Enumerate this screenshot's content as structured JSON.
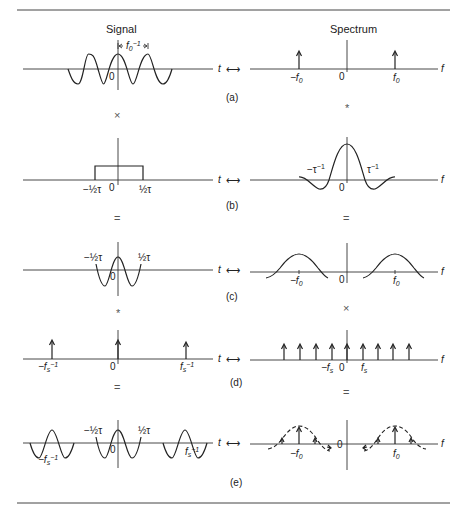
{
  "figure": {
    "column_titles": {
      "signal": "Signal",
      "spectrum": "Spectrum"
    },
    "axis_labels": {
      "time": "t",
      "freq": "f",
      "transform_pair": "⟷"
    },
    "origin": "0",
    "rows": [
      {
        "label": "(a)",
        "signal": {
          "description": "cosine of period 1/f0",
          "period_marker": "f0⁻¹",
          "period_marker_base": "f",
          "period_marker_sub": "0",
          "period_marker_sup": "−1"
        },
        "spectrum": {
          "description": "delta impulses at ±f0",
          "ticks": [
            {
              "text": "−f",
              "sub": "0"
            },
            {
              "text": "f",
              "sub": "0"
            }
          ]
        },
        "operators_below": {
          "signal": "×",
          "spectrum": "*"
        }
      },
      {
        "label": "(b)",
        "signal": {
          "description": "rectangular window of width τ",
          "ticks": [
            {
              "text": "−½τ"
            },
            {
              "text": "½τ"
            }
          ]
        },
        "spectrum": {
          "description": "sinc function",
          "ticks": [
            {
              "text": "−τ",
              "sup": "−1"
            },
            {
              "text": "τ",
              "sup": "−1"
            }
          ]
        },
        "operators_below": {
          "signal": "=",
          "spectrum": "="
        }
      },
      {
        "label": "(c)",
        "signal": {
          "description": "windowed cosine burst",
          "ticks": [
            {
              "text": "−½τ"
            },
            {
              "text": "½τ"
            }
          ]
        },
        "spectrum": {
          "description": "sinc lobes centered at ±f0",
          "ticks": [
            {
              "text": "−f",
              "sub": "0"
            },
            {
              "text": "f",
              "sub": "0"
            }
          ]
        },
        "operators_below": {
          "signal": "*",
          "spectrum": "×"
        }
      },
      {
        "label": "(d)",
        "signal": {
          "description": "impulse train with spacing 1/fs",
          "ticks": [
            {
              "text": "−f",
              "sub": "s",
              "sup": "−1"
            },
            {
              "text": "f",
              "sub": "s",
              "sup": "−1"
            }
          ]
        },
        "spectrum": {
          "description": "impulse train with spacing fs",
          "ticks": [
            {
              "text": "−f",
              "sub": "s"
            },
            {
              "text": "f",
              "sub": "s"
            }
          ]
        },
        "operators_below": {
          "signal": "=",
          "spectrum": "="
        }
      },
      {
        "label": "(e)",
        "signal": {
          "description": "periodic repetition of windowed cosine",
          "ticks": [
            {
              "text": "−½τ"
            },
            {
              "text": "½τ"
            },
            {
              "text": "−f",
              "sub": "s",
              "sup": "−1"
            },
            {
              "text": "f",
              "sub": "s",
              "sup": "−1"
            }
          ]
        },
        "spectrum": {
          "description": "sampled sinc lobes (dashed envelope) at ±f0",
          "ticks": [
            {
              "text": "−f",
              "sub": "0"
            },
            {
              "text": "f",
              "sub": "0"
            }
          ]
        }
      }
    ]
  }
}
